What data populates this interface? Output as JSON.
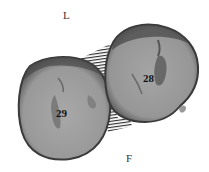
{
  "diagram": {
    "orientation_labels": {
      "top": "L",
      "bottom": "F"
    },
    "teeth": [
      {
        "number": "29",
        "position": "left"
      },
      {
        "number": "28",
        "position": "right"
      }
    ],
    "contact_area": {
      "pattern": "hatched"
    },
    "colors": {
      "background": "#ffffff",
      "tooth_fill": "#9a9a9a",
      "tooth_edge": "#3a3a3a",
      "hatch": "#222222"
    }
  }
}
